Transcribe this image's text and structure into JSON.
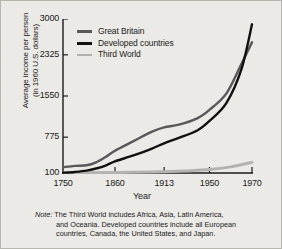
{
  "chart_data": {
    "type": "line",
    "title": "",
    "xlabel": "Year",
    "ylabel": "Average income per person (in 1960 U.S. dollars)",
    "ylabel_line1": "Average income per person",
    "ylabel_line2": "(in 1960 U.S. dollars)",
    "xticks": [
      1750,
      1860,
      1913,
      1950,
      1970
    ],
    "xtick_labels": [
      "1750",
      "1860",
      "1913",
      "1950",
      "1970"
    ],
    "xtick_positions_pct": [
      0,
      27.5,
      53.5,
      77.5,
      100
    ],
    "yticks": [
      100,
      775,
      1550,
      2325,
      3000
    ],
    "ytick_labels": [
      "100",
      "775",
      "1550",
      "2325",
      "3000"
    ],
    "ylim": [
      100,
      3000
    ],
    "grid": false,
    "legend_position": "top-left",
    "series": [
      {
        "name": "Great Britain",
        "color": "#58585a",
        "x": [
          1750,
          1775,
          1800,
          1820,
          1840,
          1860,
          1880,
          1900,
          1913,
          1925,
          1940,
          1950,
          1958,
          1965,
          1970
        ],
        "values": [
          210,
          235,
          245,
          300,
          400,
          520,
          700,
          880,
          960,
          1010,
          1130,
          1290,
          1600,
          2150,
          2560
        ]
      },
      {
        "name": "Developed countries",
        "color": "#111111",
        "x": [
          1750,
          1775,
          1800,
          1820,
          1840,
          1860,
          1880,
          1900,
          1913,
          1925,
          1940,
          1950,
          1958,
          1965,
          1970
        ],
        "values": [
          105,
          120,
          145,
          185,
          240,
          320,
          430,
          560,
          660,
          760,
          900,
          1080,
          1420,
          2050,
          2900
        ]
      },
      {
        "name": "Third World",
        "color": "#b3b2ae",
        "x": [
          1750,
          1800,
          1860,
          1900,
          1913,
          1930,
          1950,
          1960,
          1970
        ],
        "values": [
          100,
          103,
          108,
          118,
          125,
          140,
          165,
          215,
          300
        ]
      }
    ],
    "note": {
      "label": "Note:",
      "line1": "The Third World includes Africa, Asia, Latin America,",
      "line2": "and Oceania. Developed countries include all European",
      "line3": "countries, Canada, the United States, and Japan."
    }
  },
  "legend": {
    "items": [
      {
        "label": "Great Britain",
        "color": "#58585a"
      },
      {
        "label": "Developed countries",
        "color": "#111111"
      },
      {
        "label": "Third World",
        "color": "#b3b2ae"
      }
    ]
  },
  "colors": {
    "background": "#eceae6",
    "axis": "#1a1a1a",
    "great_britain": "#58585a",
    "developed_countries": "#111111",
    "third_world": "#b3b2ae"
  }
}
